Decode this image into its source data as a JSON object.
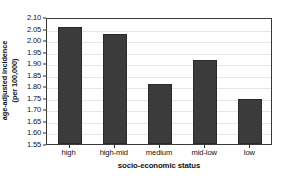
{
  "chart_data": {
    "type": "bar",
    "title": "",
    "categories": [
      "high",
      "high-mid",
      "medium",
      "mid-low",
      "low"
    ],
    "values": [
      2.058,
      2.028,
      1.808,
      1.915,
      1.745
    ],
    "xlabel": "socio-economic status",
    "ylabel": "age-adjusted incidence\n(per 100,000)",
    "ylabel_line1": "age-adjusted incidence",
    "ylabel_line2": "(per 100,000)",
    "ylim": [
      1.55,
      2.1
    ],
    "ytick_step": 0.05,
    "yticks": [
      "2.10",
      "2.05",
      "2.00",
      "1.95",
      "1.90",
      "1.85",
      "1.80",
      "1.75",
      "1.70",
      "1.65",
      "1.60",
      "1.55"
    ],
    "ytick_values": [
      2.1,
      2.05,
      2.0,
      1.95,
      1.9,
      1.85,
      1.8,
      1.75,
      1.7,
      1.65,
      1.6,
      1.55
    ],
    "grid": true,
    "legend": "none",
    "bar_color": "#3b3b3b",
    "axis_color": "#3a3a3a",
    "grid_color": "#e6e6e6",
    "background": "#ffffff"
  }
}
